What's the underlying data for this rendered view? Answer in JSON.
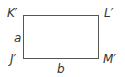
{
  "diagram": {
    "type": "rectangle",
    "vertices": {
      "top_left": "K′",
      "top_right": "L′",
      "bottom_right": "M′",
      "bottom_left": "J′"
    },
    "sides": {
      "left": "a",
      "bottom": "b"
    },
    "colors": {
      "stroke": "#555555",
      "text": "#333333",
      "background": "#ffffff"
    }
  }
}
